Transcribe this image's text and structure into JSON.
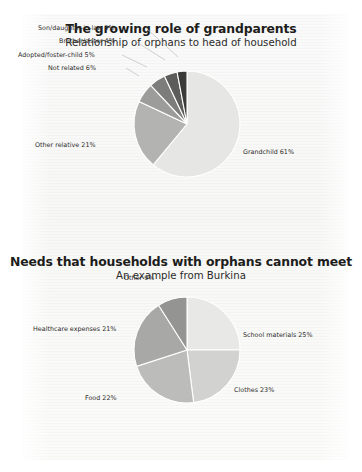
{
  "page": {
    "background_color": "#ffffff",
    "paper_color": "#f8f8f7"
  },
  "charts": [
    {
      "id": "grandparents",
      "title": "The growing role of grandparents",
      "subtitle": "Relationship of orphans to head of household"
    },
    {
      "id": "needs",
      "title": "Needs that households with orphans cannot meet",
      "subtitle": "An example from Burkina"
    }
  ],
  "chart_data": [
    {
      "type": "pie",
      "title": "The growing role of grandparents",
      "subtitle": "Relationship of orphans to head of household",
      "xlabel": "",
      "ylabel": "",
      "legend_position": "none",
      "grid": false,
      "unit": "percent",
      "categories": [
        "Grandchild",
        "Other relative",
        "Not related",
        "Adopted/foster-child",
        "Brother/sister",
        "Son/daughter-in-law"
      ],
      "values": [
        61,
        21,
        6,
        5,
        4,
        3
      ],
      "labels": [
        "Grandchild 61%",
        "Other relative 21%",
        "Not related 6%",
        "Adopted/foster-child 5%",
        "Brother/sister 4%",
        "Son/daughter-in-law 3%"
      ],
      "colors": [
        "#e6e6e4",
        "#b3b3b1",
        "#9c9c9a",
        "#7d7d7b",
        "#5c5c5a",
        "#3a3a38"
      ]
    },
    {
      "type": "pie",
      "title": "Needs that households with orphans cannot meet",
      "subtitle": "An example from Burkina",
      "xlabel": "",
      "ylabel": "",
      "legend_position": "none",
      "grid": false,
      "unit": "percent",
      "categories": [
        "School materials",
        "Clothes",
        "Food",
        "Healthcare expenses",
        "Other"
      ],
      "values": [
        25,
        23,
        22,
        21,
        9
      ],
      "labels": [
        "School materials 25%",
        "Clothes 23%",
        "Food 22%",
        "Healthcare expenses 21%",
        "Other 9%"
      ],
      "colors": [
        "#e8e8e6",
        "#d2d2d0",
        "#bcbcba",
        "#a8a8a6",
        "#949492"
      ]
    }
  ]
}
